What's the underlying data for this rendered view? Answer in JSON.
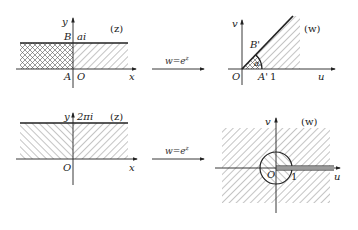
{
  "diagram": {
    "panels": [
      {
        "id": "top-z",
        "plane_label": "(z)",
        "axes": {
          "x": "x",
          "y": "y"
        },
        "points": {
          "B": "B",
          "top": "ai",
          "A": "A",
          "origin": "O"
        }
      },
      {
        "id": "top-w",
        "plane_label": "(w)",
        "axes": {
          "x": "u",
          "y": "v"
        },
        "points": {
          "B": "B'",
          "angle": "α",
          "A": "A'",
          "one": "1",
          "origin": "O"
        }
      },
      {
        "id": "bottom-z",
        "plane_label": "(z)",
        "axes": {
          "x": "x",
          "y": "y"
        },
        "points": {
          "top": "2πi",
          "origin": "O"
        }
      },
      {
        "id": "bottom-w",
        "plane_label": "(w)",
        "axes": {
          "x": "u",
          "y": "v"
        },
        "points": {
          "one": "1",
          "origin": "O"
        }
      }
    ],
    "arrows": [
      {
        "label_base": "w=e",
        "label_sup": "z"
      },
      {
        "label_base": "w=e",
        "label_sup": "z"
      }
    ]
  },
  "colors": {
    "ink": "#222222",
    "hatch": "#555555",
    "background": "#ffffff"
  }
}
